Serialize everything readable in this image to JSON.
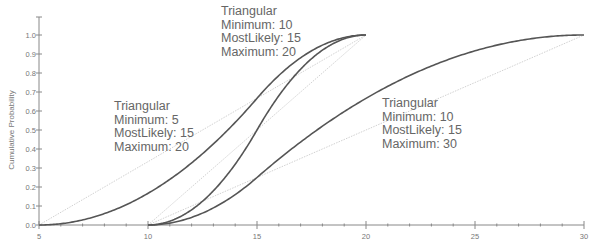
{
  "chart_data": {
    "type": "line",
    "title": "",
    "xlabel": "",
    "ylabel": "Cumulative Probability",
    "xlim": [
      5,
      30
    ],
    "ylim": [
      0,
      1.0
    ],
    "x_ticks": [
      "5",
      "10",
      "15",
      "20",
      "25",
      "30"
    ],
    "y_ticks": [
      "0.0",
      "0.1",
      "0.2",
      "0.3",
      "0.4",
      "0.5",
      "0.6",
      "0.7",
      "0.8",
      "0.9",
      "1.0"
    ],
    "grid": false,
    "legend": "none (inline annotations)",
    "series": [
      {
        "name": "Triangular(5,15,20)",
        "distribution": "Triangular",
        "min": 5,
        "mode": 15,
        "max": 20
      },
      {
        "name": "Triangular(10,15,20)",
        "distribution": "Triangular",
        "min": 10,
        "mode": 15,
        "max": 20
      },
      {
        "name": "Triangular(10,15,30)",
        "distribution": "Triangular",
        "min": 10,
        "mode": 15,
        "max": 30
      }
    ],
    "reference_lines": [
      {
        "from": [
          5,
          0
        ],
        "to": [
          20,
          1
        ]
      },
      {
        "from": [
          10,
          0
        ],
        "to": [
          20,
          1
        ]
      },
      {
        "from": [
          10,
          0
        ],
        "to": [
          30,
          1
        ]
      }
    ],
    "annotations": [
      {
        "lines": [
          "Triangular",
          "Minimum: 10",
          "MostLikely: 15",
          "Maximum: 20"
        ]
      },
      {
        "lines": [
          "Triangular",
          "Minimum: 5",
          "MostLikely: 15",
          "Maximum: 20"
        ]
      },
      {
        "lines": [
          "Triangular",
          "Minimum: 10",
          "MostLikely: 15",
          "Maximum: 30"
        ]
      }
    ]
  },
  "colors": {
    "curve": "#555555",
    "reference": "#cccccc",
    "axis": "#888888",
    "text": "#666666"
  }
}
